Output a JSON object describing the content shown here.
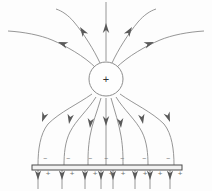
{
  "figure": {
    "background_color": "#fdfdfd",
    "line_color": "#8a8a8a",
    "arrow_color": "#5a5a5a",
    "plate_color": "#4a4a4a",
    "width": 212,
    "height": 191
  },
  "charge": {
    "label": "+",
    "symbol_name": "positive-point-charge",
    "cx": 106,
    "cy": 79,
    "r": 17
  },
  "plate": {
    "name": "grounded-conducting-plate",
    "x1": 32,
    "x2": 182,
    "y_top": 165,
    "y_bottom": 170,
    "top_sign": "−",
    "bottom_sign": "+",
    "top_sign_count": 7,
    "bottom_sign_count": 8,
    "top_signs": [
      "−",
      "−",
      "−",
      "−",
      "−",
      "−",
      "−"
    ],
    "bottom_signs": [
      "+",
      "+",
      "+",
      "+",
      "+",
      "+",
      "+",
      "+"
    ],
    "top_sign_x": [
      45,
      68,
      90,
      106,
      122,
      144,
      168
    ],
    "bottom_sign_x": [
      43,
      67,
      90,
      106,
      118,
      140,
      155,
      175
    ],
    "top_sign_y": 161,
    "bottom_sign_y": 176
  },
  "field_lines": {
    "outgoing_count": 5,
    "incoming_count": 7,
    "below_plate_count": 8,
    "outgoing": [
      {
        "name": "up-left-far",
        "d": "M 96 68 C 84 56 66 46 52 40 C 40 35 24 32 8 31",
        "arrow_x": 58,
        "arrow_y": 42,
        "arrow_angle": 200
      },
      {
        "name": "up-left-mid",
        "d": "M 100 63 C 94 50 84 34 74 22 C 68 15 62 11 56 9",
        "arrow_x": 80,
        "arrow_y": 27,
        "arrow_angle": 237
      },
      {
        "name": "up-vertical",
        "d": "M 106 61 L 106 2",
        "arrow_x": 106,
        "arrow_y": 23,
        "arrow_angle": 270
      },
      {
        "name": "up-right-mid",
        "d": "M 112 63 C 118 50 128 34 138 22 C 144 15 150 11 156 9",
        "arrow_x": 132,
        "arrow_y": 27,
        "arrow_angle": 303
      },
      {
        "name": "up-right-far",
        "d": "M 116 68 C 128 56 146 46 160 40 C 172 35 188 32 204 31",
        "arrow_x": 154,
        "arrow_y": 42,
        "arrow_angle": 340
      }
    ],
    "incoming": [
      {
        "name": "down-left-far",
        "d": "M 92 94 C 78 104 60 112 48 124 C 40 134 38 150 38 165",
        "arrow_x": 42,
        "arrow_y": 122,
        "arrow_angle": 110
      },
      {
        "name": "down-left-mid",
        "d": "M 96 97 C 88 110 76 120 70 132 C 65 142 64 154 64 165",
        "arrow_x": 69,
        "arrow_y": 124,
        "arrow_angle": 100
      },
      {
        "name": "down-left-near",
        "d": "M 101 98 C 97 112 92 124 90 136 C 88 148 88 156 88 165",
        "arrow_x": 90,
        "arrow_y": 128,
        "arrow_angle": 95
      },
      {
        "name": "down-center",
        "d": "M 106 98 L 106 165",
        "arrow_x": 106,
        "arrow_y": 126,
        "arrow_angle": 90
      },
      {
        "name": "down-right-near",
        "d": "M 111 98 C 115 112 119 124 121 136 C 123 148 123 156 123 165",
        "arrow_x": 121,
        "arrow_y": 128,
        "arrow_angle": 85
      },
      {
        "name": "down-right-mid",
        "d": "M 116 97 C 124 110 136 120 142 132 C 147 142 148 154 148 165",
        "arrow_x": 143,
        "arrow_y": 124,
        "arrow_angle": 80
      },
      {
        "name": "down-right-far",
        "d": "M 120 94 C 134 104 152 112 164 124 C 172 134 174 150 174 165",
        "arrow_x": 170,
        "arrow_y": 122,
        "arrow_angle": 70
      }
    ],
    "below_plate": [
      {
        "name": "below-1",
        "x": 38,
        "y1": 170,
        "y2": 189,
        "arrow_y": 180
      },
      {
        "name": "below-2",
        "x": 62,
        "y1": 170,
        "y2": 189,
        "arrow_y": 180
      },
      {
        "name": "below-3",
        "x": 85,
        "y1": 170,
        "y2": 189,
        "arrow_y": 180
      },
      {
        "name": "below-4",
        "x": 101,
        "y1": 170,
        "y2": 189,
        "arrow_y": 180
      },
      {
        "name": "below-5",
        "x": 113,
        "y1": 170,
        "y2": 189,
        "arrow_y": 180
      },
      {
        "name": "below-6",
        "x": 135,
        "y1": 170,
        "y2": 189,
        "arrow_y": 180
      },
      {
        "name": "below-7",
        "x": 150,
        "y1": 170,
        "y2": 189,
        "arrow_y": 180
      },
      {
        "name": "below-8",
        "x": 170,
        "y1": 170,
        "y2": 189,
        "arrow_y": 180
      }
    ]
  }
}
